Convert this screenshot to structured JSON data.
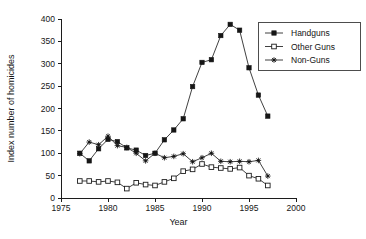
{
  "chart_data": {
    "type": "line",
    "title": "",
    "xlabel": "Year",
    "ylabel": "Index number of homicides",
    "xlim": [
      1975,
      2000
    ],
    "ylim": [
      0,
      400
    ],
    "xticks": [
      1975,
      1980,
      1985,
      1990,
      1995,
      2000
    ],
    "yticks": [
      0,
      50,
      100,
      150,
      200,
      250,
      300,
      350,
      400
    ],
    "grid": false,
    "legend_position": "top-right",
    "x": [
      1977,
      1978,
      1979,
      1980,
      1981,
      1982,
      1983,
      1984,
      1985,
      1986,
      1987,
      1988,
      1989,
      1990,
      1991,
      1992,
      1993,
      1994,
      1995,
      1996,
      1997
    ],
    "series": [
      {
        "name": "Handguns",
        "marker": "filled-square",
        "values": [
          100,
          83,
          110,
          131,
          126,
          112,
          107,
          95,
          100,
          130,
          152,
          177,
          249,
          303,
          309,
          363,
          388,
          375,
          291,
          230,
          183
        ]
      },
      {
        "name": "Other Guns",
        "marker": "open-square",
        "values": [
          38,
          38,
          36,
          38,
          35,
          21,
          34,
          30,
          28,
          36,
          44,
          60,
          64,
          76,
          69,
          67,
          65,
          68,
          50,
          43,
          28
        ]
      },
      {
        "name": "Non-Guns",
        "marker": "star",
        "values": [
          99,
          125,
          119,
          138,
          117,
          113,
          100,
          83,
          100,
          90,
          93,
          99,
          81,
          90,
          100,
          82,
          81,
          82,
          81,
          84,
          49
        ]
      }
    ]
  },
  "legend": {
    "entries": [
      {
        "label": "Handguns"
      },
      {
        "label": "Other Guns"
      },
      {
        "label": "Non-Guns"
      }
    ]
  },
  "axes": {
    "x_title": "Year",
    "y_title": "Index number of homicides"
  }
}
